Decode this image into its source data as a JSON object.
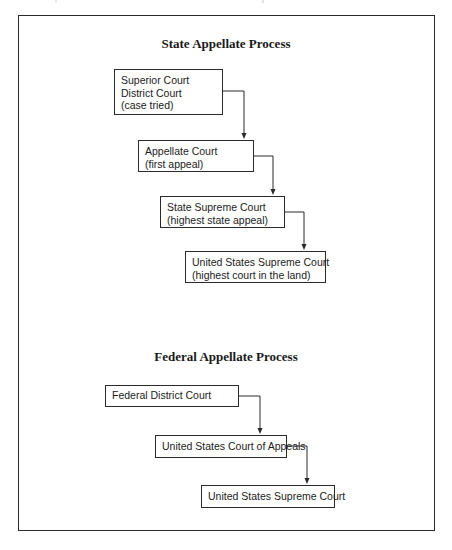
{
  "state_process": {
    "title": "State Appellate Process",
    "steps": [
      {
        "lines": [
          "Superior Court",
          "District Court",
          "(case tried)"
        ]
      },
      {
        "lines": [
          "Appellate Court",
          "(first appeal)"
        ]
      },
      {
        "lines": [
          "State Supreme Court",
          "(highest state appeal)"
        ]
      },
      {
        "lines": [
          "United States Supreme Court",
          "(highest court in the land)"
        ]
      }
    ]
  },
  "federal_process": {
    "title": "Federal Appellate Process",
    "steps": [
      {
        "lines": [
          "Federal District Court"
        ]
      },
      {
        "lines": [
          "United States Court of Appeals"
        ]
      },
      {
        "lines": [
          "United States Supreme Court"
        ]
      }
    ]
  },
  "colors": {
    "line": "#2a2a2a",
    "text": "#1c1c1c",
    "background": "#ffffff"
  }
}
